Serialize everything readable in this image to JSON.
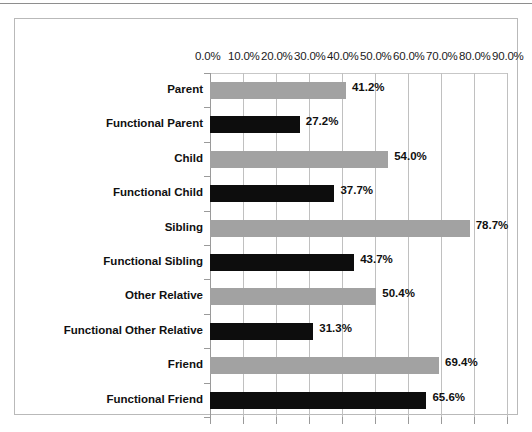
{
  "chart_data": {
    "type": "bar",
    "orientation": "horizontal",
    "title": "",
    "xlabel": "",
    "ylabel": "",
    "xlim": [
      0,
      90
    ],
    "grid": true,
    "legend": "none",
    "tick_labels": [
      "0.0%",
      "10.0%",
      "20.0%",
      "30.0%",
      "40.0%",
      "50.0%",
      "60.0%",
      "70.0%",
      "80.0%",
      "90.0%"
    ],
    "tick_values": [
      0,
      10,
      20,
      30,
      40,
      50,
      60,
      70,
      80,
      90
    ],
    "categories": [
      "Parent",
      "Functional Parent",
      "Child",
      "Functional Child",
      "Sibling",
      "Functional Sibling",
      "Other Relative",
      "Functional Other Relative",
      "Friend",
      "Functional Friend"
    ],
    "values": [
      41.2,
      27.2,
      54.0,
      37.7,
      78.7,
      43.7,
      50.4,
      31.3,
      69.4,
      65.6
    ],
    "value_labels": [
      "41.2%",
      "27.2%",
      "54.0%",
      "37.7%",
      "78.7%",
      "43.7%",
      "50.4%",
      "31.3%",
      "69.4%",
      "65.6%"
    ],
    "bar_colors": [
      "#a2a2a2",
      "#0d0d0d",
      "#a2a2a2",
      "#0d0d0d",
      "#a2a2a2",
      "#0d0d0d",
      "#a2a2a2",
      "#0d0d0d",
      "#a2a2a2",
      "#0d0d0d"
    ],
    "series": [
      {
        "name": "Relationship type",
        "values": [
          41.2,
          27.2,
          54.0,
          37.7,
          78.7,
          43.7,
          50.4,
          31.3,
          69.4,
          65.6
        ]
      }
    ],
    "colors": {
      "gray": "#a2a2a2",
      "black": "#0d0d0d",
      "gridline": "#c0c0c0",
      "frame": "#b9b9b9",
      "text": "#101010"
    }
  }
}
